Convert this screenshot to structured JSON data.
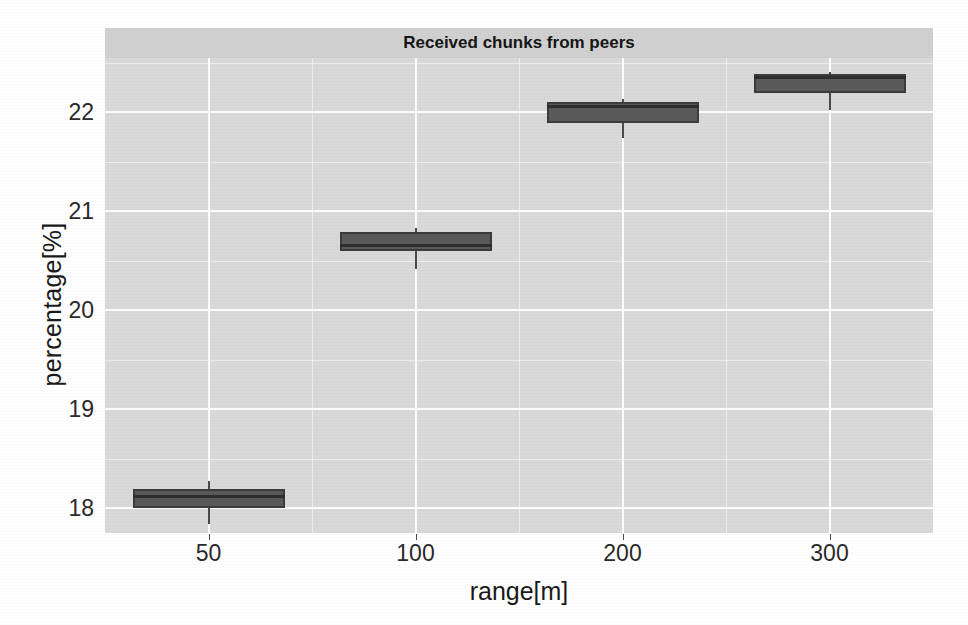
{
  "chart_data": {
    "type": "box",
    "title": "Received chunks from peers",
    "xlabel": "range[m]",
    "ylabel": "percentage[%]",
    "categories": [
      "50",
      "100",
      "200",
      "300"
    ],
    "xtick_labels": [
      "50",
      "100",
      "200",
      "300"
    ],
    "ytick_labels": [
      "18",
      "19",
      "20",
      "21",
      "22"
    ],
    "ytick_values": [
      18,
      19,
      20,
      21,
      22
    ],
    "ylim": [
      17.75,
      22.55
    ],
    "grid": true,
    "grid_color": "#ffffff",
    "panel_background": "#d9d9d9",
    "strip_background": "#d0d0d0",
    "box_fill": "#5a5a5a",
    "box_border": "#3c3c3c",
    "legend": "none",
    "boxes": [
      {
        "category": "50",
        "whisker_low": 17.84,
        "q1": 18.0,
        "median": 18.12,
        "q3": 18.19,
        "whisker_high": 18.28
      },
      {
        "category": "100",
        "whisker_low": 20.42,
        "q1": 20.6,
        "median": 20.66,
        "q3": 20.79,
        "whisker_high": 20.83
      },
      {
        "category": "200",
        "whisker_low": 21.74,
        "q1": 21.89,
        "median": 22.07,
        "q3": 22.11,
        "whisker_high": 22.14
      },
      {
        "category": "300",
        "whisker_low": 22.02,
        "q1": 22.2,
        "median": 22.36,
        "q3": 22.39,
        "whisker_high": 22.41
      }
    ]
  }
}
